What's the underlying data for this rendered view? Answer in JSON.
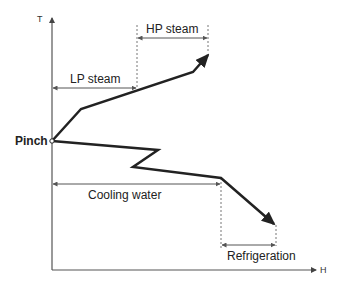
{
  "diagram": {
    "type": "grand-composite-curve",
    "axes": {
      "y_label": "T",
      "x_label": "H"
    },
    "pinch_label": "Pinch",
    "utilities": [
      {
        "name": "HP steam",
        "label": "HP steam",
        "position": "above-pinch"
      },
      {
        "name": "LP steam",
        "label": "LP steam",
        "position": "above-pinch"
      },
      {
        "name": "Cooling water",
        "label": "Cooling water",
        "position": "below-pinch"
      },
      {
        "name": "Refrigeration",
        "label": "Refrigeration",
        "position": "below-pinch"
      }
    ],
    "colors": {
      "curve": "#222222",
      "axis": "#555555",
      "dimension": "#555555"
    }
  }
}
